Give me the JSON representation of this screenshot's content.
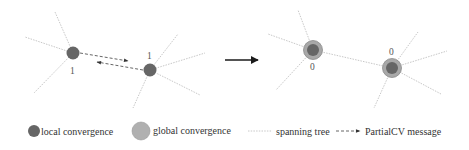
{
  "diagram": {
    "before": {
      "nodes": [
        {
          "id": "a",
          "x": 73,
          "y": 53,
          "label": "1",
          "state": "local"
        },
        {
          "id": "b",
          "x": 150,
          "y": 70,
          "label": "1",
          "state": "local"
        }
      ],
      "messages": [
        "PartialCV a->b",
        "PartialCV b->a"
      ]
    },
    "after": {
      "nodes": [
        {
          "id": "a",
          "x": 313,
          "y": 50,
          "label": "0",
          "state": "global"
        },
        {
          "id": "b",
          "x": 392,
          "y": 68,
          "label": "0",
          "state": "global"
        }
      ]
    },
    "transition_arrow": "right-arrow"
  },
  "labels": {
    "before_node_a": "1",
    "before_node_b": "1",
    "after_node_a": "0",
    "after_node_b": "0"
  },
  "legend": {
    "local": "local convergence",
    "global": "global convergence",
    "tree": "spanning tree",
    "message": "PartialCV message"
  },
  "colors": {
    "local_fill": "#666666",
    "global_fill": "#a8a8a8",
    "global_ring": "#8a8a8a",
    "tree_line": "#c8c8c8",
    "message_line": "#555555",
    "arrow": "#1a1a1a"
  }
}
